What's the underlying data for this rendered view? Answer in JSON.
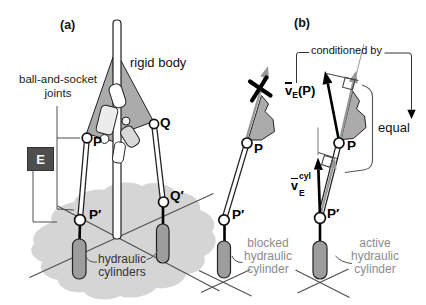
{
  "panel_a": {
    "label": "(a)",
    "rigid_body": "rigid body",
    "joints_line1": "ball-and-socket",
    "joints_line2": "joints",
    "frame": "E",
    "point_p": "P",
    "point_q": "Q",
    "point_p_prime": "P′",
    "point_q_prime": "Q′",
    "cyl_line1": "hydraulic",
    "cyl_line2": "cylinders"
  },
  "panel_mid": {
    "point_p": "P",
    "point_p_prime": "P′",
    "caption_line1": "blocked",
    "caption_line2": "hydraulic",
    "caption_line3": "cylinder"
  },
  "panel_b": {
    "label": "(b)",
    "conditioned_by": "conditioned by",
    "equal": "equal",
    "point_p": "P",
    "point_p_prime": "P′",
    "caption_line1": "active",
    "caption_line2": "hydraulic",
    "caption_line3": "cylinder",
    "v_p": {
      "base": "v",
      "sub": "E",
      "arg": "(P)"
    },
    "v_cyl": {
      "base": "v",
      "sub": "E",
      "sup": "cyl"
    }
  },
  "colors": {
    "wedge": "#ababab",
    "gray_arrow": "#989898",
    "cylinder_fill": "#9d9d9d",
    "shadow_blob": "#d5d5d5",
    "frame_box": "#4e4e4e"
  }
}
